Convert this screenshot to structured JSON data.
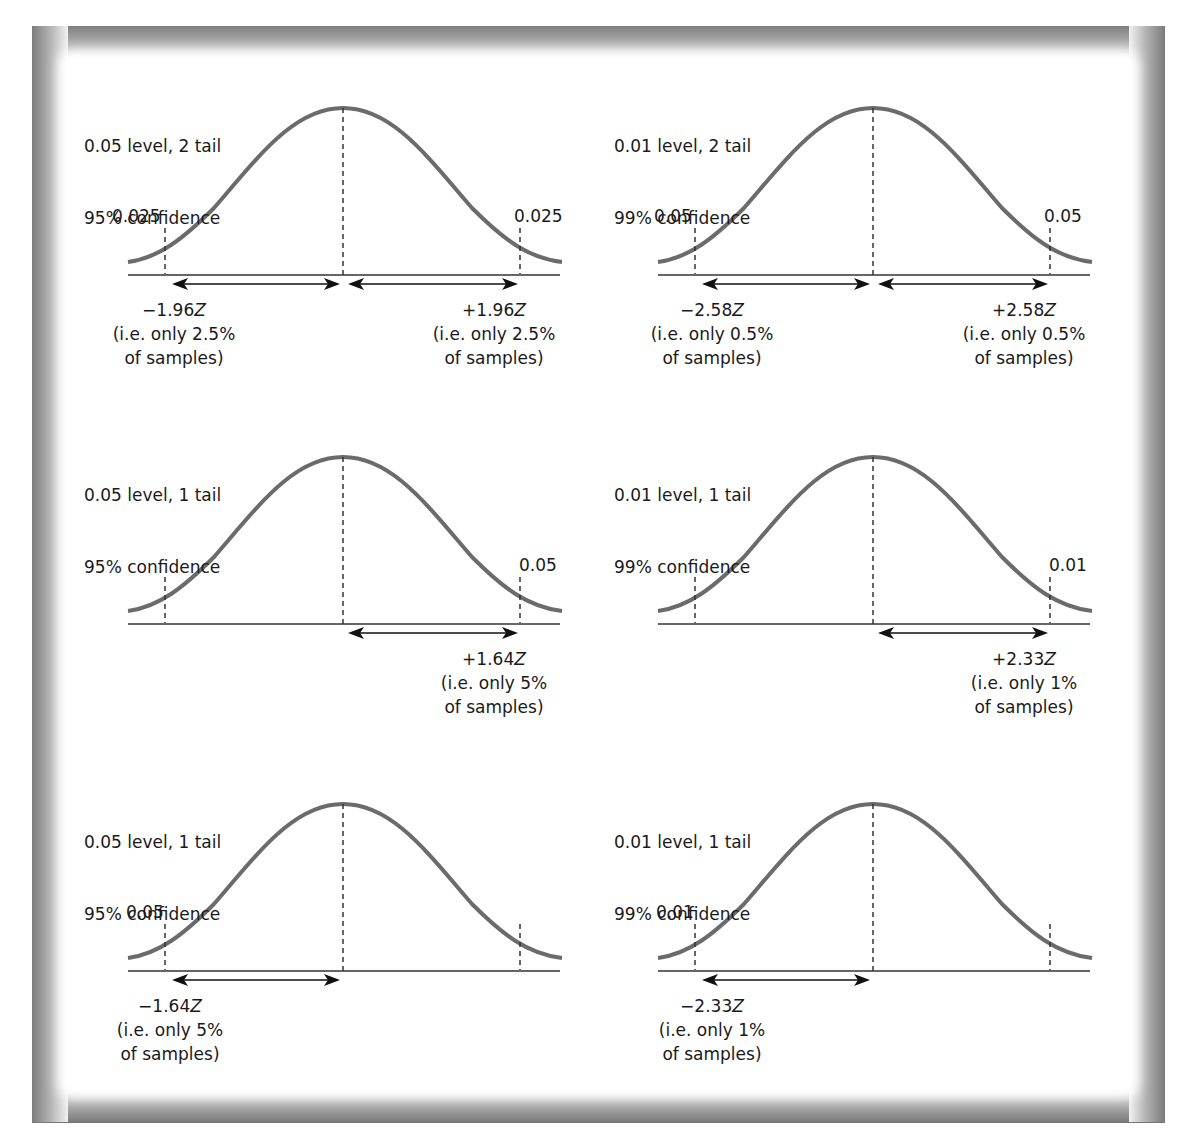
{
  "figure": {
    "panels": [
      {
        "id": "p1",
        "title_line1": "0.05 level, 2 tail",
        "title_line2": "95% confidence",
        "tail_left": "0.025",
        "tail_right": "0.025",
        "z_left": {
          "value": "−1.96",
          "unit": "Z",
          "line2": "(i.e. only 2.5%",
          "line3": "of samples)"
        },
        "z_right": {
          "value": "+1.96",
          "unit": "Z",
          "line2": "(i.e. only 2.5%",
          "line3": "of samples)"
        }
      },
      {
        "id": "p2",
        "title_line1": "0.01 level, 2 tail",
        "title_line2": "99% confidence",
        "tail_left": "0.05",
        "tail_right": "0.05",
        "z_left": {
          "value": "−2.58",
          "unit": "Z",
          "line2": "(i.e. only 0.5%",
          "line3": "of samples)"
        },
        "z_right": {
          "value": "+2.58",
          "unit": "Z",
          "line2": "(i.e. only 0.5%",
          "line3": "of samples)"
        }
      },
      {
        "id": "p3",
        "title_line1": "0.05 level, 1 tail",
        "title_line2": "95% confidence",
        "tail_right": "0.05",
        "z_right": {
          "value": "+1.64",
          "unit": "Z",
          "line2": "(i.e. only 5%",
          "line3": "of samples)"
        }
      },
      {
        "id": "p4",
        "title_line1": "0.01 level, 1 tail",
        "title_line2": "99% confidence",
        "tail_right": "0.01",
        "z_right": {
          "value": "+2.33",
          "unit": "Z",
          "line2": "(i.e. only 1%",
          "line3": "of samples)"
        }
      },
      {
        "id": "p5",
        "title_line1": "0.05 level, 1 tail",
        "title_line2": "95% confidence",
        "tail_left": "0.05",
        "z_left": {
          "value": "−1.64",
          "unit": "Z",
          "line2": "(i.e. only 5%",
          "line3": "of samples)"
        }
      },
      {
        "id": "p6",
        "title_line1": "0.01 level, 1 tail",
        "title_line2": "99% confidence",
        "tail_left": "0.01",
        "z_left": {
          "value": "−2.33",
          "unit": "Z",
          "line2": "(i.e. only 1%",
          "line3": "of samples)"
        }
      }
    ],
    "colors": {
      "curve": "#6b6b6b",
      "axis": "#333333",
      "text": "#1a1a1a",
      "frame_dark": "#7a7a7a"
    }
  }
}
